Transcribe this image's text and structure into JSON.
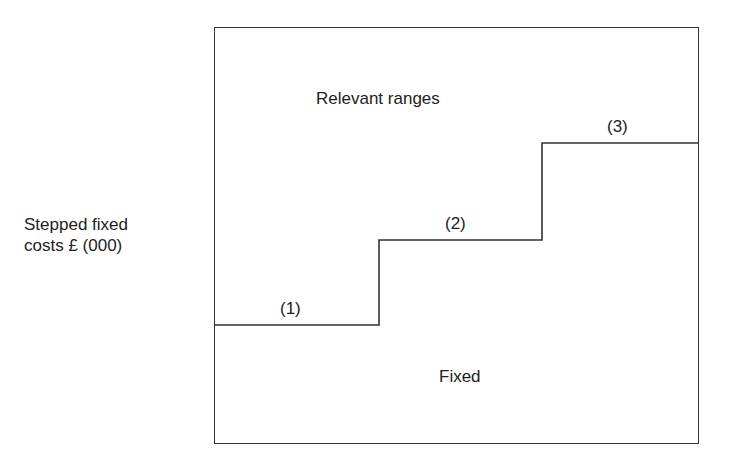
{
  "diagram": {
    "type": "stepped-fixed-cost",
    "y_axis_label_line1": "Stepped fixed",
    "y_axis_label_line2": "costs £ (000)",
    "top_label": "Relevant ranges",
    "bottom_label": "Fixed",
    "steps": [
      {
        "label": "(1)",
        "x_start": 214,
        "x_end": 379,
        "y": 325
      },
      {
        "label": "(2)",
        "x_start": 379,
        "x_end": 542,
        "y": 240
      },
      {
        "label": "(3)",
        "x_start": 542,
        "x_end": 699,
        "y": 143
      }
    ],
    "line_color": "#333333"
  }
}
